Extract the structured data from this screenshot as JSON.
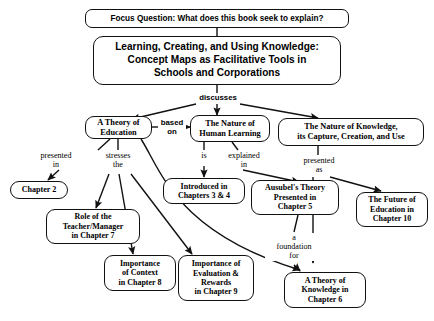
{
  "diagram": {
    "title_box": "Learning, Creating, and Using Knowledge:\nConcept Maps as Facilitative Tools in\nSchools and Corporations",
    "focus_question": "Focus Question: What does this book seek to explain?"
  },
  "nodes": {
    "theory_education": "A Theory of\nEducation",
    "human_learning": "The Nature of\nHuman Learning",
    "nature_knowledge": "The Nature of Knowledge,\nits Capture, Creation, and Use",
    "chapter2": "Chapter 2",
    "role_teacher": "Role of the\nTeacher/Manager\nin Chapter 7",
    "importance_context": "Importance\nof Context\nin Chapter 8",
    "importance_evaluation": "Importance of\nEvaluation &\nRewards\nin Chapter 9",
    "introduced_in": "Introduced in\nChapters 3 & 4",
    "ausubel": "Ausubel's Theory\nPresented in\nChapter 5",
    "theory_knowledge": "A Theory of\nKnowledge in\nChapter 6",
    "future_education": "The Future of\nEducation in\nChapter 10"
  },
  "link_labels": {
    "discusses": "discusses",
    "based_on": "based\non",
    "presented_in": "presented\nin",
    "stresses_the": "stresses\nthe",
    "is": "is",
    "explained_in": "explained\nin",
    "presented_as": "presented\nas",
    "foundation_for": "a\nfoundation\nfor"
  },
  "colors": {
    "stroke": "#111111",
    "background": "#ffffff",
    "text": "#000000"
  }
}
